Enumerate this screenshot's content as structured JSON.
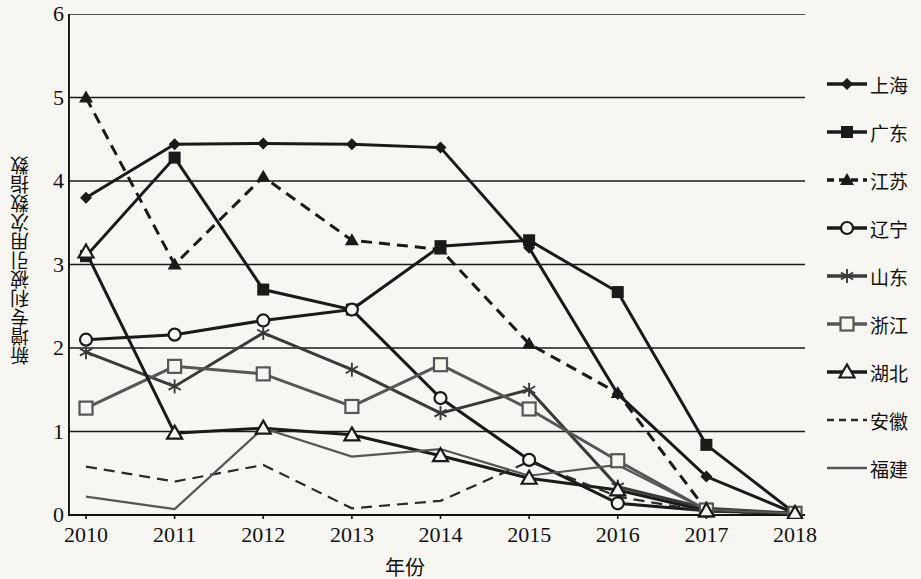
{
  "chart_data": {
    "type": "line",
    "title": "",
    "xlabel": "年份",
    "ylabel": "新增专利被引用次数指数",
    "x": [
      "2010",
      "2011",
      "2012",
      "2013",
      "2014",
      "2015",
      "2016",
      "2017",
      "2018"
    ],
    "categories": [
      "2010",
      "2011",
      "2012",
      "2013",
      "2014",
      "2015",
      "2016",
      "2017",
      "2018"
    ],
    "ylim": [
      0,
      6
    ],
    "yticks": [
      "0",
      "1",
      "2",
      "3",
      "4",
      "5",
      "6"
    ],
    "grid": "horizontal",
    "legend_position": "right",
    "series": [
      {
        "name": "上海",
        "marker": "diamond",
        "line": "solid",
        "color": "#1a1a1a",
        "values": [
          3.8,
          4.44,
          4.45,
          4.44,
          4.4,
          3.2,
          1.45,
          0.46,
          0.02
        ]
      },
      {
        "name": "广东",
        "marker": "square",
        "line": "solid",
        "color": "#1a1a1a",
        "values": [
          3.1,
          4.28,
          2.7,
          2.46,
          3.22,
          3.29,
          2.67,
          0.84,
          0.02
        ]
      },
      {
        "name": "江苏",
        "marker": "triangle",
        "line": "dashed",
        "color": "#1a1a1a",
        "values": [
          5.0,
          3.0,
          4.05,
          3.29,
          3.18,
          2.05,
          1.46,
          0.06,
          0.02
        ]
      },
      {
        "name": "辽宁",
        "marker": "circle-open",
        "line": "solid",
        "color": "#1a1a1a",
        "values": [
          2.1,
          2.16,
          2.33,
          2.46,
          1.4,
          0.66,
          0.14,
          0.05,
          0.02
        ]
      },
      {
        "name": "山东",
        "marker": "asterisk",
        "line": "solid",
        "color": "#3a3a3a",
        "values": [
          1.95,
          1.54,
          2.18,
          1.74,
          1.22,
          1.5,
          0.34,
          0.08,
          0.02
        ]
      },
      {
        "name": "浙江",
        "marker": "square-open",
        "line": "solid",
        "color": "#565656",
        "values": [
          1.28,
          1.78,
          1.69,
          1.3,
          1.8,
          1.27,
          0.65,
          0.06,
          0.02
        ]
      },
      {
        "name": "湖北",
        "marker": "triangle-open",
        "line": "solid",
        "color": "#1a1a1a",
        "values": [
          3.15,
          0.98,
          1.04,
          0.96,
          0.71,
          0.44,
          0.3,
          0.05,
          0.02
        ]
      },
      {
        "name": "安徽",
        "marker": "none",
        "line": "dashed",
        "color": "#2a2a2a",
        "values": [
          0.58,
          0.4,
          0.6,
          0.08,
          0.17,
          0.64,
          0.22,
          0.04,
          0.02
        ]
      },
      {
        "name": "福建",
        "marker": "none",
        "line": "solid",
        "color": "#565656",
        "values": [
          0.22,
          0.07,
          1.04,
          0.7,
          0.79,
          0.47,
          0.6,
          0.06,
          0.02
        ]
      }
    ]
  },
  "legend": {
    "items": [
      {
        "label": "上海"
      },
      {
        "label": "广东"
      },
      {
        "label": "江苏"
      },
      {
        "label": "辽宁"
      },
      {
        "label": "山东"
      },
      {
        "label": "浙江"
      },
      {
        "label": "湖北"
      },
      {
        "label": "安徽"
      },
      {
        "label": "福建"
      }
    ]
  }
}
